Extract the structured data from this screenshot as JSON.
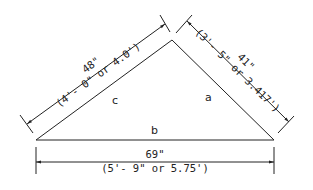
{
  "diagram": {
    "type": "triangle-dimension-drawing",
    "sides": {
      "a": {
        "label": "a",
        "dimension": "41\"",
        "conversion": "(3'- 5\" or 3.417')"
      },
      "b": {
        "label": "b",
        "dimension": "69\"",
        "conversion": "(5'- 9\" or 5.75')"
      },
      "c": {
        "label": "c",
        "dimension": "48\"",
        "conversion": "(4'- 0\" or 4.0')"
      }
    },
    "colors": {
      "line": "#222222",
      "background": "#ffffff"
    }
  }
}
